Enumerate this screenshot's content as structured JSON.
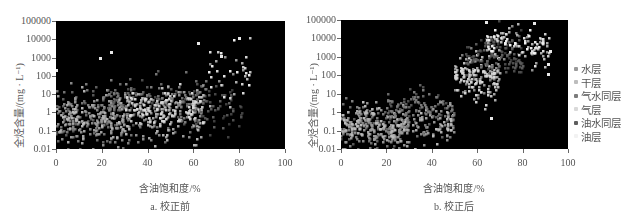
{
  "chart_data": [
    {
      "type": "scatter",
      "id": "a",
      "title": "a. 校正前",
      "xlabel": "含油饱和度/%",
      "ylabel": "全烃含量/(mg · L⁻¹)",
      "xlim": [
        0,
        100
      ],
      "ylim": [
        0.01,
        100000
      ],
      "yscale": "log",
      "xticks": [
        "0",
        "20",
        "40",
        "60",
        "80",
        "100"
      ],
      "yticks": [
        "100000",
        "10000",
        "1000",
        "100",
        "10",
        "1",
        "0.1",
        "0.01"
      ],
      "grid": false,
      "legend_position": "none",
      "clusters": [
        {
          "series": "水层",
          "x_range": [
            0,
            30
          ],
          "log_y_center": -0.3,
          "log_y_spread": 1.2,
          "count": 220
        },
        {
          "series": "干层",
          "x_range": [
            0,
            65
          ],
          "log_y_center": -0.4,
          "log_y_spread": 1.1,
          "count": 230
        },
        {
          "series": "气水同层",
          "x_range": [
            20,
            66
          ],
          "log_y_center": 0.6,
          "log_y_spread": 1.0,
          "count": 180
        },
        {
          "series": "气层",
          "x_range": [
            30,
            65
          ],
          "log_y_center": 0.3,
          "log_y_spread": 1.0,
          "count": 170
        },
        {
          "series": "油水同层",
          "x_range": [
            60,
            82
          ],
          "log_y_center": 0.4,
          "log_y_spread": 1.2,
          "count": 60
        },
        {
          "series": "油层",
          "x_range": [
            66,
            85
          ],
          "log_y_center": 2.2,
          "log_y_spread": 1.3,
          "count": 40
        }
      ],
      "notable_points": [
        {
          "x": 19,
          "y": 1000
        },
        {
          "x": 24,
          "y": 2000
        },
        {
          "x": 62,
          "y": 6000
        },
        {
          "x": 72,
          "y": 1200
        },
        {
          "x": 80,
          "y": 12000
        },
        {
          "x": 0,
          "y": 200
        }
      ]
    },
    {
      "type": "scatter",
      "id": "b",
      "title": "b. 校正后",
      "xlabel": "含油饱和度/%",
      "ylabel": "全烃含量/(mg · L⁻¹)",
      "xlim": [
        0,
        100
      ],
      "ylim": [
        0.01,
        100000
      ],
      "yscale": "log",
      "xticks": [
        "0",
        "20",
        "40",
        "60",
        "80",
        "100"
      ],
      "yticks": [
        "100000",
        "10000",
        "1000",
        "100",
        "10",
        "1",
        "0.1",
        "0.01"
      ],
      "grid": false,
      "legend_position": "right",
      "legend": [
        "水层",
        "干层",
        "气水同层",
        "气层",
        "油水同层",
        "油层"
      ],
      "clusters": [
        {
          "series": "水层",
          "x_range": [
            0,
            30
          ],
          "log_y_center": -0.8,
          "log_y_spread": 0.9,
          "count": 230
        },
        {
          "series": "干层",
          "x_range": [
            0,
            50
          ],
          "log_y_center": -0.7,
          "log_y_spread": 1.0,
          "count": 220
        },
        {
          "series": "气水同层",
          "x_range": [
            20,
            50
          ],
          "log_y_center": 0.2,
          "log_y_spread": 1.0,
          "count": 120
        },
        {
          "series": "气层",
          "x_range": [
            50,
            70
          ],
          "log_y_center": 2.0,
          "log_y_spread": 1.0,
          "count": 170
        },
        {
          "series": "油水同层",
          "x_range": [
            55,
            80
          ],
          "log_y_center": 3.0,
          "log_y_spread": 0.9,
          "count": 130
        },
        {
          "series": "油层",
          "x_range": [
            64,
            92
          ],
          "log_y_center": 3.7,
          "log_y_spread": 0.8,
          "count": 110
        }
      ],
      "notable_points": [
        {
          "x": 64,
          "y": 80000
        },
        {
          "x": 85,
          "y": 70000
        },
        {
          "x": 92,
          "y": 2000
        },
        {
          "x": 91,
          "y": 400
        },
        {
          "x": 91,
          "y": 120
        },
        {
          "x": 66,
          "y": 0.5
        }
      ]
    }
  ],
  "series_styles": [
    {
      "name": "水层",
      "color": "#9a9a9a"
    },
    {
      "name": "干层",
      "color": "#bdbdbd"
    },
    {
      "name": "气水同层",
      "color": "#7c7c7c"
    },
    {
      "name": "气层",
      "color": "#d9d9d9"
    },
    {
      "name": "油水同层",
      "color": "#5e5e5e"
    },
    {
      "name": "油层",
      "color": "#f2f2f2"
    }
  ],
  "panels": {
    "a": {
      "caption": "a. 校正前",
      "xlabel": "含油饱和度/%",
      "ylabel": "全烃含量/(mg · L⁻¹)"
    },
    "b": {
      "caption": "b. 校正后",
      "xlabel": "含油饱和度/%",
      "ylabel": "全烃含量/(mg · L⁻¹)"
    }
  },
  "legend": {
    "items": [
      {
        "label": "水层",
        "color": "#9a9a9a"
      },
      {
        "label": "干层",
        "color": "#bdbdbd"
      },
      {
        "label": "气水同层",
        "color": "#7c7c7c"
      },
      {
        "label": "气层",
        "color": "#d9d9d9"
      },
      {
        "label": "油水同层",
        "color": "#5e5e5e"
      },
      {
        "label": "油层",
        "color": "#f2f2f2"
      }
    ]
  },
  "plot_background": "#000000"
}
